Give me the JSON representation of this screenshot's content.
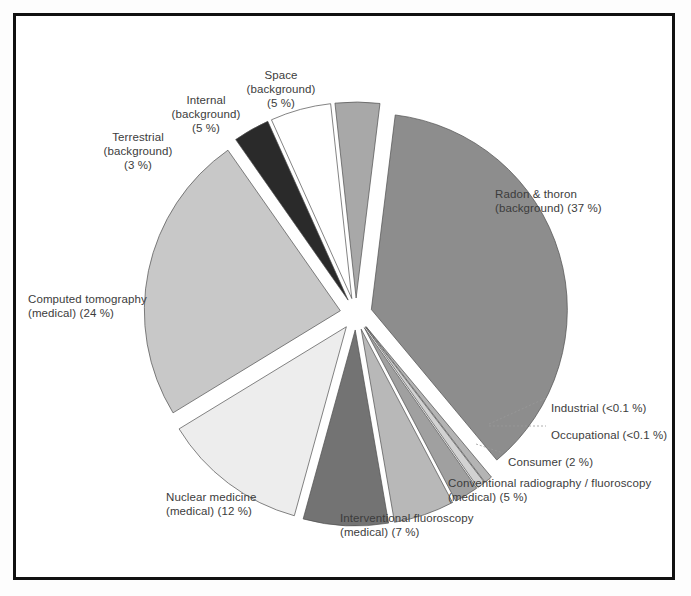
{
  "figure": {
    "background_color": "#ffffff",
    "frame_color": "#111111",
    "label_color": "#3c3c3c"
  },
  "chart_data": {
    "type": "pie",
    "title": "",
    "subtitle": "",
    "xlabel": "",
    "ylabel": "",
    "units": "percent of total effective dose",
    "legend_position": "none",
    "grid": false,
    "labels_inline": true,
    "total": 100,
    "categories": [
      "Radon & thoron (background)",
      "Industrial",
      "Occupational",
      "Consumer",
      "Conventional radiography / fluoroscopy (medical)",
      "Interventional fluoroscopy (medical)",
      "Nuclear medicine (medical)",
      "Computed tomography (medical)",
      "Terrestrial (background)",
      "Internal (background)",
      "Space (background)"
    ],
    "values": [
      37,
      0.1,
      0.1,
      2,
      5,
      7,
      12,
      24,
      3,
      5,
      5
    ],
    "value_labels": [
      "37 %",
      "<0.1 %",
      "<0.1 %",
      "2 %",
      "5 %",
      "7 %",
      "12 %",
      "24 %",
      "3 %",
      "5 %",
      "5 %"
    ],
    "colors": [
      "#8d8d8d",
      "#b4b4b4",
      "#d2d2d2",
      "#a0a0a0",
      "#b8b8b8",
      "#737373",
      "#ededed",
      "#c8c8c8",
      "#2a2a2a",
      "#ffffff",
      "#a8a8a8"
    ],
    "slices": [
      {
        "id": "radon-thoron",
        "name": "Radon & thoron (background)",
        "value": 37,
        "value_label": "37 %",
        "color": "#8d8d8d",
        "label_line1": "Radon & thoron",
        "label_line2": "(background) (37 %)",
        "start_angle": -83,
        "end_angle": 50.2,
        "explode": 16
      },
      {
        "id": "industrial",
        "name": "Industrial",
        "value": 0.1,
        "value_label": "<0.1 %",
        "color": "#b4b4b4",
        "label_line1": "Industrial (<0.1 %)",
        "label_line2": "",
        "start_angle": 50.2,
        "end_angle": 52.6,
        "explode": 16
      },
      {
        "id": "occupational",
        "name": "Occupational",
        "value": 0.1,
        "value_label": "<0.1 %",
        "color": "#d2d2d2",
        "label_line1": "Occupational (<0.1 %)",
        "label_line2": "",
        "start_angle": 52.6,
        "end_angle": 55.0,
        "explode": 16
      },
      {
        "id": "consumer",
        "name": "Consumer",
        "value": 2,
        "value_label": "2 %",
        "color": "#a0a0a0",
        "label_line1": "Consumer (2 %)",
        "label_line2": "",
        "start_angle": 55.0,
        "end_angle": 62.2,
        "explode": 16
      },
      {
        "id": "conventional-radiography",
        "name": "Conventional radiography / fluoroscopy (medical)",
        "value": 5,
        "value_label": "5 %",
        "color": "#b8b8b8",
        "label_line1": "Conventional radiography / fluoroscopy",
        "label_line2": "(medical) (5 %)",
        "start_angle": 62.2,
        "end_angle": 80.2,
        "explode": 16
      },
      {
        "id": "interventional-fluoroscopy",
        "name": "Interventional fluoroscopy (medical)",
        "value": 7,
        "value_label": "7 %",
        "color": "#737373",
        "label_line1": "Interventional fluoroscopy",
        "label_line2": "(medical) (7 %)",
        "start_angle": 80.2,
        "end_angle": 105.4,
        "explode": 16
      },
      {
        "id": "nuclear-medicine",
        "name": "Nuclear medicine (medical)",
        "value": 12,
        "value_label": "12 %",
        "color": "#ededed",
        "label_line1": "Nuclear medicine",
        "label_line2": "(medical) (12 %)",
        "start_angle": 105.4,
        "end_angle": 148.6,
        "explode": 16
      },
      {
        "id": "computed-tomography",
        "name": "Computed tomography (medical)",
        "value": 24,
        "value_label": "24 %",
        "color": "#c8c8c8",
        "label_line1": "Computed tomography",
        "label_line2": "(medical) (24 %)",
        "start_angle": 148.6,
        "end_angle": 235.0,
        "explode": 16
      },
      {
        "id": "terrestrial",
        "name": "Terrestrial (background)",
        "value": 3,
        "value_label": "3 %",
        "color": "#2a2a2a",
        "label_line1": "Terrestrial",
        "label_line2": "(background)\n(3 %)",
        "start_angle": 235.0,
        "end_angle": 245.8,
        "explode": 16
      },
      {
        "id": "internal",
        "name": "Internal (background)",
        "value": 5,
        "value_label": "5 %",
        "color": "#ffffff",
        "label_line1": "Internal",
        "label_line2": "(background)\n(5 %)",
        "start_angle": 245.8,
        "end_angle": 263.8,
        "explode": 16
      },
      {
        "id": "space",
        "name": "Space (background)",
        "value": 5,
        "value_label": "5 %",
        "color": "#a8a8a8",
        "label_line1": "Space",
        "label_line2": "(background)\n(5 %)",
        "start_angle": 263.8,
        "end_angle": 277.0,
        "explode": 16
      }
    ],
    "geometry": {
      "center_x": 356,
      "center_y": 314,
      "radius": 196
    },
    "annotations": [
      {
        "id": "label-radon",
        "text": "Radon & thoron\n(background) (37 %)",
        "x": 495,
        "y": 187,
        "align": "left"
      },
      {
        "id": "label-industrial",
        "text": "Industrial (<0.1 %)",
        "x": 551,
        "y": 401,
        "align": "left"
      },
      {
        "id": "label-occupational",
        "text": "Occupational (<0.1 %)",
        "x": 551,
        "y": 428,
        "align": "left"
      },
      {
        "id": "label-consumer",
        "text": "Consumer (2 %)",
        "x": 508,
        "y": 455,
        "align": "left"
      },
      {
        "id": "label-conventional",
        "text": "Conventional radiography / fluoroscopy\n(medical) (5 %)",
        "x": 448,
        "y": 476,
        "align": "left"
      },
      {
        "id": "label-interventional",
        "text": "Interventional fluoroscopy\n(medical) (7 %)",
        "x": 340,
        "y": 511,
        "align": "left"
      },
      {
        "id": "label-nuclear",
        "text": "Nuclear medicine\n(medical) (12 %)",
        "x": 166,
        "y": 490,
        "align": "left"
      },
      {
        "id": "label-ct",
        "text": "Computed tomography\n(medical) (24 %)",
        "x": 28,
        "y": 292,
        "align": "left"
      },
      {
        "id": "label-terrestrial",
        "text": "Terrestrial\n(background)\n(3 %)",
        "x": 138,
        "y": 130,
        "align": "center"
      },
      {
        "id": "label-internal",
        "text": "Internal\n(background)\n(5 %)",
        "x": 206,
        "y": 93,
        "align": "center"
      },
      {
        "id": "label-space",
        "text": "Space\n(background)\n(5 %)",
        "x": 281,
        "y": 68,
        "align": "center"
      }
    ],
    "leader_lines": [
      {
        "id": "leader-industrial",
        "points": [
          [
            489,
            424
          ],
          [
            546,
            398
          ]
        ]
      },
      {
        "id": "leader-occupational",
        "points": [
          [
            489,
            426
          ],
          [
            546,
            426
          ]
        ]
      },
      {
        "id": "leader-consumer",
        "points": [
          [
            476,
            444
          ],
          [
            503,
            453
          ]
        ]
      }
    ]
  }
}
